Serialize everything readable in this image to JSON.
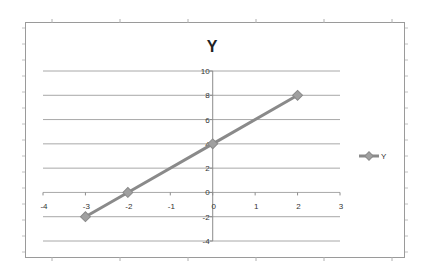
{
  "chart_data": {
    "type": "line",
    "subtype": "scatter-with-lines-and-markers",
    "title": "Y",
    "xlabel": "",
    "ylabel": "",
    "xlim": [
      -4,
      3
    ],
    "ylim": [
      -4,
      10
    ],
    "x_ticks": [
      -4,
      -3,
      -2,
      -1,
      0,
      1,
      2,
      3
    ],
    "y_ticks": [
      -4,
      -2,
      0,
      2,
      4,
      6,
      8,
      10
    ],
    "grid": {
      "horizontal": true,
      "vertical": false
    },
    "legend_position": "right",
    "series": [
      {
        "name": "Y",
        "x": [
          -3,
          -2,
          0,
          2
        ],
        "values": [
          -2,
          0,
          4,
          8
        ],
        "color": "#8a8a8a",
        "marker": "diamond"
      }
    ]
  },
  "colors": {
    "background": "#ffffff",
    "frame": "#9a9a9a",
    "gridline": "#a8a8a8",
    "axis": "#8c8c8c",
    "tick_label": "#333333",
    "title": "#222222",
    "series_line": "#8a8a8a",
    "marker_fill": "#a0a0a0"
  }
}
